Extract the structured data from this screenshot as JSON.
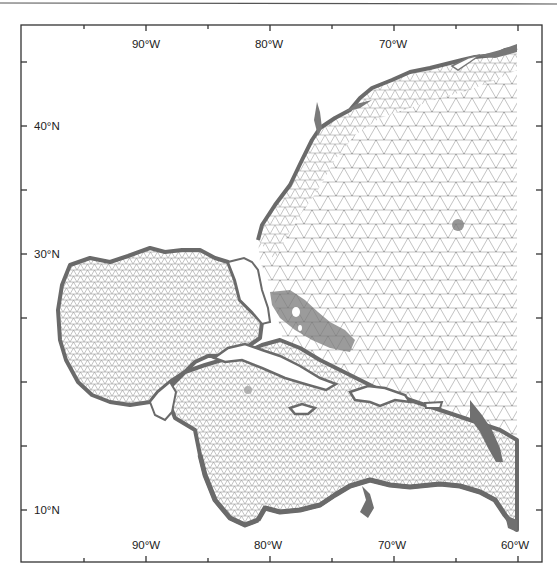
{
  "map": {
    "type": "finite-element ocean mesh",
    "region": "Western North Atlantic, Gulf of Mexico and Caribbean Sea",
    "longitude_range_deg": [
      -97,
      -58
    ],
    "latitude_range_deg": [
      8,
      46
    ],
    "top_axis_labels": [
      "90°W",
      "80°W",
      "70°W"
    ],
    "bottom_axis_labels": [
      "90°W",
      "80°W",
      "70°W",
      "60°W"
    ],
    "left_axis_labels": [
      "40°N",
      "30°N",
      "10°N"
    ],
    "x_ticks_deg": [
      -95,
      -90,
      -85,
      -80,
      -75,
      -70,
      -65,
      -60
    ],
    "y_ticks_deg": [
      45,
      40,
      35,
      30,
      25,
      20,
      15,
      10
    ],
    "colors": {
      "frame": "#333333",
      "mesh_line": "#8a8a8a",
      "coast_dense": "#6e6e6e",
      "land": "#ffffff"
    }
  }
}
